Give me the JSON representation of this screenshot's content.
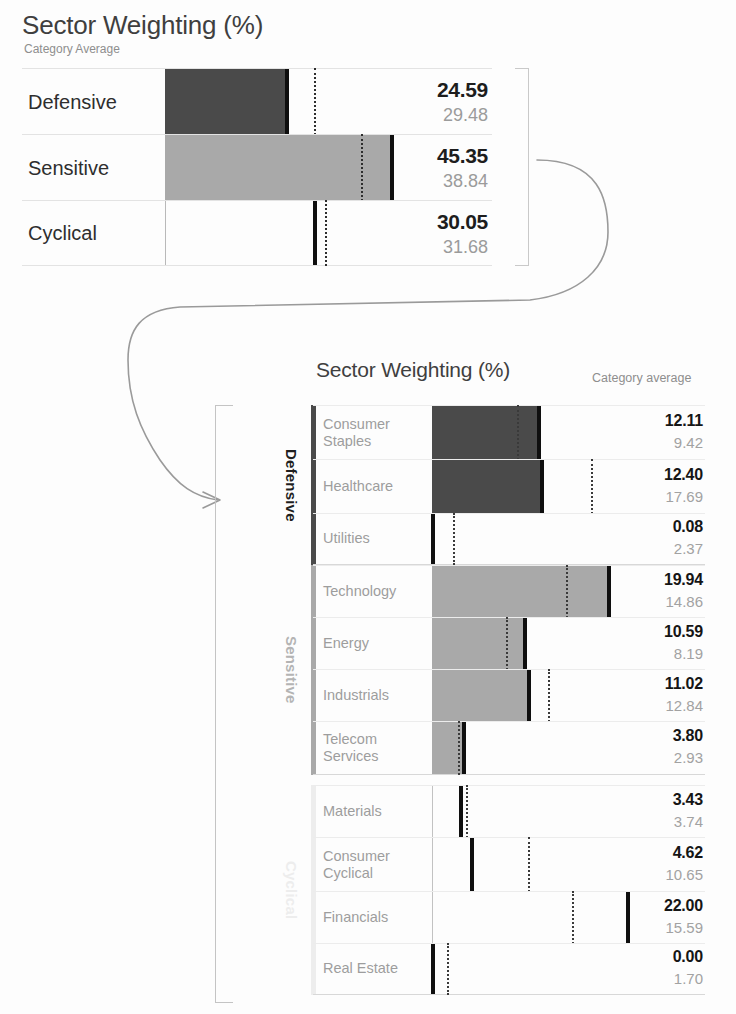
{
  "top": {
    "title": "Sector Weighting (%)",
    "subtitle": "Category Average",
    "rows": [
      {
        "label": "Defensive",
        "value": "24.59",
        "average": "29.48"
      },
      {
        "label": "Sensitive",
        "value": "45.35",
        "average": "38.84"
      },
      {
        "label": "Cyclical",
        "value": "30.05",
        "average": "31.68"
      }
    ]
  },
  "bottom": {
    "title": "Sector Weighting (%)",
    "subtitle": "Category average",
    "groups": [
      {
        "name": "Defensive",
        "rows": [
          {
            "label": "Consumer\nStaples",
            "value": "12.11",
            "average": "9.42"
          },
          {
            "label": "Healthcare",
            "value": "12.40",
            "average": "17.69"
          },
          {
            "label": "Utilities",
            "value": "0.08",
            "average": "2.37"
          }
        ]
      },
      {
        "name": "Sensitive",
        "rows": [
          {
            "label": "Technology",
            "value": "19.94",
            "average": "14.86"
          },
          {
            "label": "Energy",
            "value": "10.59",
            "average": "8.19"
          },
          {
            "label": "Industrials",
            "value": "11.02",
            "average": "12.84"
          },
          {
            "label": "Telecom\nServices",
            "value": "3.80",
            "average": "2.93"
          }
        ]
      },
      {
        "name": "Cyclical",
        "rows": [
          {
            "label": "Materials",
            "value": "3.43",
            "average": "3.74"
          },
          {
            "label": "Consumer\nCyclical",
            "value": "4.62",
            "average": "10.65"
          },
          {
            "label": "Financials",
            "value": "22.00",
            "average": "15.59"
          },
          {
            "label": "Real Estate",
            "value": "0.00",
            "average": "1.70"
          }
        ]
      }
    ]
  },
  "colors": {
    "defensive": "#4a4a4a",
    "sensitive": "#a9a9a9",
    "cyclical": "#ededed",
    "marker": "#0f0f0f",
    "value_text": "#151515",
    "average_text": "#a2a2a2",
    "label_text": "#9d9d9d",
    "title_text": "#3f3f3f",
    "arrow": "#9a9a9a"
  },
  "chart_data": [
    {
      "type": "bar",
      "title": "Sector Weighting (%)",
      "subtitle": "Category Average",
      "orientation": "horizontal",
      "categories": [
        "Defensive",
        "Sensitive",
        "Cyclical"
      ],
      "series": [
        {
          "name": "Portfolio",
          "values": [
            24.59,
            45.35,
            30.05
          ]
        },
        {
          "name": "Category Average",
          "values": [
            29.48,
            38.84,
            31.68
          ]
        }
      ],
      "xlabel": "",
      "ylabel": "",
      "xlim": [
        0,
        50
      ],
      "grid": false,
      "legend": "none"
    },
    {
      "type": "bar",
      "title": "Sector Weighting (%)",
      "subtitle": "Category average",
      "orientation": "horizontal",
      "groups": [
        "Defensive",
        "Sensitive",
        "Cyclical"
      ],
      "categories": [
        "Consumer Staples",
        "Healthcare",
        "Utilities",
        "Technology",
        "Energy",
        "Industrials",
        "Telecom Services",
        "Materials",
        "Consumer Cyclical",
        "Financials",
        "Real Estate"
      ],
      "series": [
        {
          "name": "Portfolio",
          "values": [
            12.11,
            12.4,
            0.08,
            19.94,
            10.59,
            11.02,
            3.8,
            3.43,
            4.62,
            22.0,
            0.0
          ]
        },
        {
          "name": "Category average",
          "values": [
            9.42,
            17.69,
            2.37,
            14.86,
            8.19,
            12.84,
            2.93,
            3.74,
            10.65,
            15.59,
            1.7
          ]
        }
      ],
      "xlabel": "",
      "ylabel": "",
      "xlim": [
        0,
        30
      ],
      "grid": false,
      "legend": "none"
    }
  ]
}
